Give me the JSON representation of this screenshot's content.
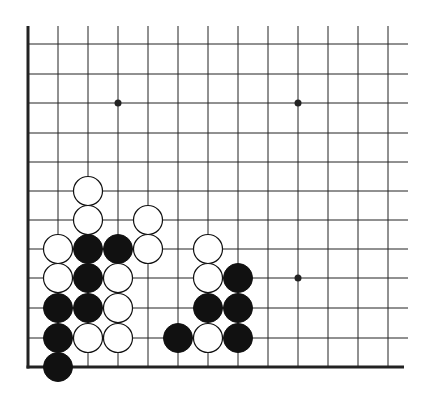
{
  "diagram": {
    "type": "go-board-diagram",
    "region": "lower-left corner",
    "colors": {
      "background": "#ffffff",
      "line": "#222222",
      "black_stone": "#111111",
      "white_stone": "#ffffff"
    },
    "grid": {
      "columns_x": [
        28,
        58,
        88,
        118,
        148,
        178,
        208,
        238,
        268,
        298,
        328,
        358,
        388
      ],
      "rows_y": [
        44,
        74,
        103,
        133,
        162,
        191,
        220,
        249,
        278,
        308,
        338,
        367
      ],
      "top_y": 26,
      "right_x": 408,
      "left_edge": true,
      "bottom_edge": true
    },
    "star_points": [
      {
        "col": 3,
        "row": 2
      },
      {
        "col": 9,
        "row": 2
      },
      {
        "col": 9,
        "row": 8
      }
    ],
    "stones": [
      {
        "color": "white",
        "col": 2,
        "row": 5
      },
      {
        "color": "white",
        "col": 2,
        "row": 6
      },
      {
        "color": "white",
        "col": 4,
        "row": 6
      },
      {
        "color": "white",
        "col": 1,
        "row": 7
      },
      {
        "color": "black",
        "col": 2,
        "row": 7
      },
      {
        "color": "black",
        "col": 3,
        "row": 7
      },
      {
        "color": "white",
        "col": 4,
        "row": 7
      },
      {
        "color": "white",
        "col": 6,
        "row": 7
      },
      {
        "color": "white",
        "col": 1,
        "row": 8
      },
      {
        "color": "black",
        "col": 2,
        "row": 8
      },
      {
        "color": "white",
        "col": 3,
        "row": 8
      },
      {
        "color": "white",
        "col": 6,
        "row": 8
      },
      {
        "color": "black",
        "col": 7,
        "row": 8
      },
      {
        "color": "black",
        "col": 1,
        "row": 9
      },
      {
        "color": "black",
        "col": 2,
        "row": 9
      },
      {
        "color": "white",
        "col": 3,
        "row": 9
      },
      {
        "color": "black",
        "col": 6,
        "row": 9
      },
      {
        "color": "black",
        "col": 7,
        "row": 9
      },
      {
        "color": "black",
        "col": 1,
        "row": 10
      },
      {
        "color": "white",
        "col": 2,
        "row": 10
      },
      {
        "color": "white",
        "col": 3,
        "row": 10
      },
      {
        "color": "black",
        "col": 5,
        "row": 10
      },
      {
        "color": "white",
        "col": 6,
        "row": 10
      },
      {
        "color": "black",
        "col": 7,
        "row": 10
      },
      {
        "color": "black",
        "col": 1,
        "row": 11
      }
    ],
    "stone_radius": 14.5
  }
}
